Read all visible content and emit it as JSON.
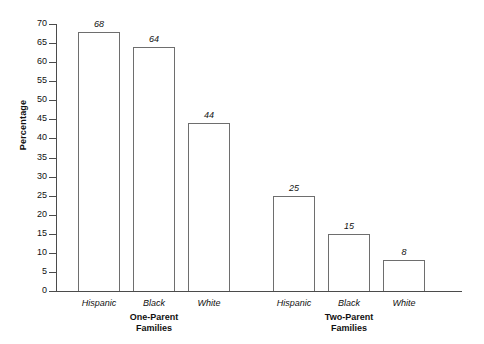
{
  "chart_data": {
    "type": "bar",
    "title": "",
    "xlabel": "",
    "ylabel": "Percentage",
    "ylim": [
      0,
      70
    ],
    "ytick_step": 5,
    "grid": false,
    "legend": "none",
    "yticks": [
      "70",
      "65",
      "60",
      "55",
      "50",
      "45",
      "40",
      "35",
      "30",
      "25",
      "20",
      "15",
      "10",
      "5",
      "0"
    ],
    "categories": [
      "Hispanic",
      "Black",
      "White",
      "Hispanic",
      "Black",
      "White"
    ],
    "values": [
      68,
      64,
      44,
      25,
      15,
      8
    ],
    "groups": [
      {
        "label_line1": "One-Parent",
        "label_line2": "Families",
        "categories": [
          "Hispanic",
          "Black",
          "White"
        ],
        "values": [
          68,
          64,
          44
        ]
      },
      {
        "label_line1": "Two-Parent",
        "label_line2": "Families",
        "categories": [
          "Hispanic",
          "Black",
          "White"
        ],
        "values": [
          25,
          15,
          8
        ]
      }
    ],
    "colors": {
      "bar_fill": "#ffffff",
      "bar_stroke": "#6e6e6e",
      "axis": "#4b4b4b",
      "text": "#111111",
      "background": "#ffffff"
    }
  }
}
